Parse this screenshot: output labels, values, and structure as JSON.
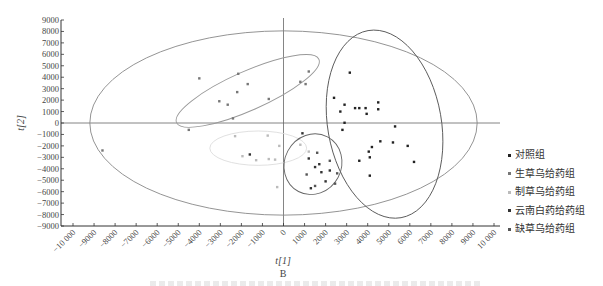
{
  "chart_data": {
    "type": "scatter",
    "title": "",
    "panel_label": "B",
    "xlabel": "t[1]",
    "ylabel": "t[2]",
    "xlim": [
      -10000,
      10000
    ],
    "ylim": [
      -9000,
      9000
    ],
    "x_ticks": [
      -10000,
      -9000,
      -8000,
      -7000,
      -6000,
      -5000,
      -4000,
      -3000,
      -2000,
      -1000,
      0,
      1000,
      2000,
      3000,
      4000,
      5000,
      6000,
      7000,
      8000,
      9000,
      10000
    ],
    "x_tick_labels": [
      "-10 000",
      "-9000",
      "-8000",
      "-7000",
      "-6000",
      "-5000",
      "-4000",
      "-3000",
      "-2000",
      "-1000",
      "0",
      "1000",
      "2000",
      "3000",
      "4000",
      "5000",
      "6000",
      "7000",
      "8000",
      "9000",
      "10 000"
    ],
    "y_ticks": [
      9000,
      8000,
      7000,
      6000,
      5000,
      4000,
      3000,
      2000,
      1000,
      0,
      -1000,
      -2000,
      -3000,
      -4000,
      -5000,
      -6000,
      -7000,
      -8000,
      -9000
    ],
    "y_tick_labels": [
      "9000",
      "8000",
      "7000",
      "6000",
      "5000",
      "4000",
      "3000",
      "2000",
      "1000",
      "0",
      "-1000",
      "-2000",
      "-3000",
      "-4000",
      "-5000",
      "-6000",
      "-7000",
      "-8000",
      "-9000"
    ],
    "grid": false,
    "legend_position": "right",
    "hotelling_ellipse": {
      "center": [
        0,
        0
      ],
      "radius_x": 9200,
      "radius_y": 8050,
      "color": "#888888"
    },
    "series": [
      {
        "name": "对照组",
        "color": "#222222",
        "ellipse": {
          "center": [
            4800,
            -100
          ],
          "rx": 2700,
          "ry": 8300,
          "rotation_deg": -10,
          "color": "#555555"
        },
        "points": [
          [
            3150,
            4400
          ],
          [
            2400,
            2200
          ],
          [
            2900,
            1600
          ],
          [
            2700,
            1000
          ],
          [
            3400,
            1300
          ],
          [
            3600,
            1300
          ],
          [
            3900,
            1300
          ],
          [
            3950,
            800
          ],
          [
            4500,
            1800
          ],
          [
            4500,
            1200
          ],
          [
            2900,
            20
          ],
          [
            5300,
            -300
          ],
          [
            4600,
            -1600
          ],
          [
            5200,
            -1700
          ],
          [
            5900,
            -2000
          ],
          [
            4200,
            -2100
          ],
          [
            4050,
            -2500
          ],
          [
            4100,
            -3000
          ],
          [
            3600,
            -3300
          ],
          [
            6200,
            -3400
          ],
          [
            4100,
            -4600
          ],
          [
            2800,
            -600
          ]
        ]
      },
      {
        "name": "生草乌给药组",
        "color": "#777777",
        "ellipse": {
          "center": [
            -1700,
            2800
          ],
          "rx": 3700,
          "ry": 1700,
          "rotation_deg": -24,
          "color": "#999999"
        },
        "points": [
          [
            -4000,
            3900
          ],
          [
            -2150,
            4300
          ],
          [
            -1700,
            3400
          ],
          [
            -2200,
            2700
          ],
          [
            -3050,
            1900
          ],
          [
            -2650,
            1600
          ],
          [
            -2400,
            400
          ],
          [
            -700,
            2100
          ],
          [
            1200,
            4500
          ],
          [
            800,
            3600
          ],
          [
            1050,
            3400
          ],
          [
            -4500,
            -600
          ],
          [
            -8600,
            -2400
          ]
        ]
      },
      {
        "name": "制草乌给药组",
        "color": "#bbbbbb",
        "ellipse": {
          "center": [
            -1200,
            -2200
          ],
          "rx": 2300,
          "ry": 1500,
          "rotation_deg": 0,
          "color": "#dddddd"
        },
        "points": [
          [
            -2300,
            -1150
          ],
          [
            -750,
            -1100
          ],
          [
            -200,
            -2000
          ],
          [
            -700,
            -3150
          ],
          [
            -1950,
            -2900
          ],
          [
            -1300,
            -3250
          ],
          [
            -400,
            -3200
          ],
          [
            800,
            -1900
          ],
          [
            1200,
            -2500
          ],
          [
            -300,
            -5600
          ]
        ]
      },
      {
        "name": "云南白药给药组",
        "color": "#333333",
        "ellipse": {
          "center": [
            1400,
            -3600
          ],
          "rx": 1350,
          "ry": 2700,
          "rotation_deg": 28,
          "color": "#666666"
        },
        "points": [
          [
            900,
            -900
          ],
          [
            1200,
            -3100
          ],
          [
            1800,
            -4300
          ],
          [
            1700,
            -3600
          ],
          [
            1500,
            -3850
          ],
          [
            2200,
            -4150
          ],
          [
            2000,
            -5100
          ],
          [
            1300,
            -5700
          ],
          [
            -1600,
            -2750
          ]
        ]
      },
      {
        "name": "缺草乌给药组",
        "color": "#555555",
        "points": [
          [
            1600,
            -2600
          ],
          [
            2200,
            -3300
          ],
          [
            1100,
            -4500
          ],
          [
            2550,
            -4400
          ],
          [
            2450,
            -5300
          ],
          [
            1500,
            -5500
          ]
        ]
      }
    ]
  },
  "legend": {
    "items": [
      {
        "label": "对照组",
        "color": "#222222"
      },
      {
        "label": "生草乌给药组",
        "color": "#777777"
      },
      {
        "label": "制草乌给药组",
        "color": "#bbbbbb"
      },
      {
        "label": "云南白药给药组",
        "color": "#333333"
      },
      {
        "label": "缺草乌给药组",
        "color": "#555555"
      }
    ]
  }
}
